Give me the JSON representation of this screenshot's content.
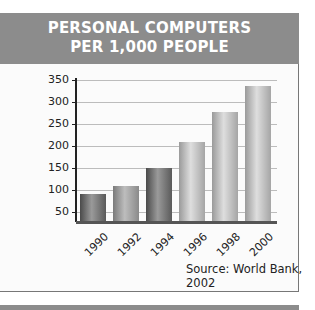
{
  "header": {
    "line1": "PERSONAL COMPUTERS",
    "line2": "PER 1,000 PEOPLE"
  },
  "source": "Source: World Bank, 2002",
  "colors": {
    "header_bg": "#8c8c8c",
    "header_text": "#ffffff"
  },
  "y_ticks": [
    "350",
    "300",
    "250",
    "200",
    "150",
    "100",
    "50"
  ],
  "x_ticks": [
    "1990",
    "1992",
    "1994",
    "1996",
    "1998",
    "2000"
  ],
  "chart_data": {
    "type": "bar",
    "title": "PERSONAL COMPUTERS PER 1,000 PEOPLE",
    "categories": [
      "1990",
      "1992",
      "1994",
      "1996",
      "1998",
      "2000"
    ],
    "values": [
      90,
      108,
      150,
      207,
      277,
      335
    ],
    "xlabel": "",
    "ylabel": "",
    "ylim": [
      25,
      350
    ],
    "yticks": [
      50,
      100,
      150,
      200,
      250,
      300,
      350
    ],
    "grid": true,
    "legend": null,
    "annotations": [
      "Source: World Bank, 2002"
    ]
  }
}
